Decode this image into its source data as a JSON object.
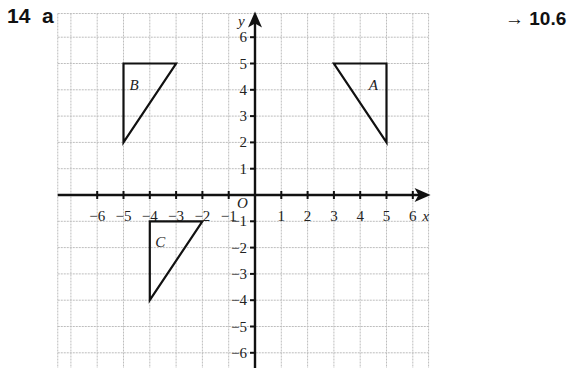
{
  "question": {
    "number": "14",
    "part": "a"
  },
  "reference": {
    "arrow": "→",
    "section": "10.6"
  },
  "chart_data": {
    "type": "scatter",
    "title": "",
    "xlabel": "x",
    "ylabel": "y",
    "origin_label": "O",
    "xlim": [
      -6,
      6
    ],
    "ylim": [
      -6,
      6
    ],
    "grid": true,
    "x_ticks": [
      -6,
      -5,
      -4,
      -3,
      -2,
      -1,
      1,
      2,
      3,
      4,
      5,
      6
    ],
    "y_ticks": [
      -6,
      -5,
      -4,
      -3,
      -2,
      -1,
      1,
      2,
      3,
      4,
      5,
      6
    ],
    "shapes": [
      {
        "name": "A",
        "vertices": [
          [
            3,
            5
          ],
          [
            5,
            5
          ],
          [
            5,
            2
          ]
        ],
        "label_pos": [
          4.5,
          4.2
        ]
      },
      {
        "name": "B",
        "vertices": [
          [
            -5,
            5
          ],
          [
            -3,
            5
          ],
          [
            -5,
            2
          ]
        ],
        "label_pos": [
          -4.6,
          4.2
        ]
      },
      {
        "name": "C",
        "vertices": [
          [
            -4,
            -1
          ],
          [
            -2,
            -1
          ],
          [
            -4,
            -4
          ]
        ],
        "label_pos": [
          -3.6,
          -1.8
        ]
      }
    ]
  }
}
